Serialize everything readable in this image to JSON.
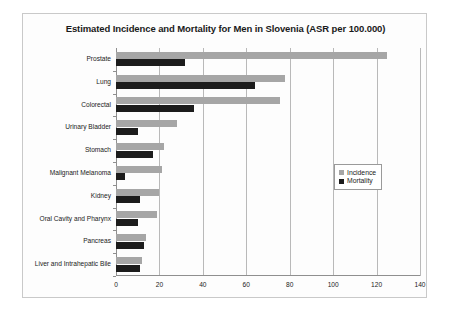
{
  "chart_data": {
    "type": "bar",
    "orientation": "horizontal",
    "title": "Estimated Incidence and Mortality for Men in Slovenia (ASR per 100.000)",
    "xlabel": "",
    "ylabel": "",
    "xlim": [
      0,
      140
    ],
    "xticks": [
      0,
      20,
      40,
      60,
      80,
      100,
      120,
      140
    ],
    "grid": true,
    "legend_position": "center-right",
    "categories": [
      "Prostate",
      "Lung",
      "Colorectal",
      "Urinary Bladder",
      "Stomach",
      "Malignant Melanoma",
      "Kidney",
      "Oral Cavity and Pharynx",
      "Pancreas",
      "Liver and Intrahepatic Bile"
    ],
    "series": [
      {
        "name": "Incidence",
        "color": "#a6a6a6",
        "values": [
          125,
          78,
          75.5,
          28,
          22,
          21,
          20,
          19,
          14,
          12
        ]
      },
      {
        "name": "Mortality",
        "color": "#1c1c1c",
        "values": [
          32,
          64,
          36,
          10,
          17,
          4,
          11,
          10,
          13,
          11
        ]
      }
    ]
  }
}
